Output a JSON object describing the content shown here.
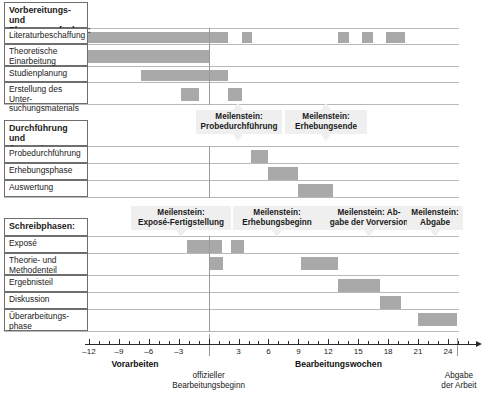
{
  "chart_data": {
    "type": "bar",
    "orientation": "horizontal",
    "xlabel": "Bearbeitungswochen",
    "ylabel": "",
    "xlim": [
      -13,
      27
    ],
    "x_ticks_major": [
      -12,
      -9,
      -6,
      -3,
      0,
      3,
      6,
      9,
      12,
      15,
      18,
      21,
      24
    ],
    "x_tick_labels": [
      "–12",
      "–9",
      "–6",
      "–3",
      "",
      "3",
      "6",
      "9",
      "12",
      "15",
      "18",
      "21",
      "24"
    ],
    "x_tick_step_minor": 1,
    "grid": false,
    "bar_color": "#a9a9a9",
    "reference_line_x": 0,
    "axis_captions": {
      "left": "Vorarbeiten",
      "right": "Bearbeitungswochen",
      "zero_note": "offizieller\nBearbeitungsbeginn",
      "end_note": "Abgabe\nder Arbeit"
    },
    "groups": [
      {
        "id": "vorbereitung",
        "header": "Vorbereitungs- und\nPlanungsaufgaben:",
        "tasks": [
          {
            "label": "Literaturbeschaffung",
            "segments": [
              [
                -12.5,
                0.0
              ],
              [
                0.0,
                1.9
              ],
              [
                3.3,
                4.4
              ],
              [
                13.0,
                14.1
              ],
              [
                15.4,
                16.5
              ],
              [
                17.8,
                19.7
              ]
            ]
          },
          {
            "label": "Theoretische\nEinarbeitung",
            "segments": [
              [
                -12.5,
                0.0
              ]
            ]
          },
          {
            "label": "Studienplanung",
            "segments": [
              [
                -6.8,
                1.9
              ]
            ]
          },
          {
            "label": "Erstellung des Unter-\nsuchungsmaterials",
            "segments": [
              [
                -2.8,
                -1.0
              ],
              [
                1.9,
                3.3
              ]
            ]
          }
        ]
      },
      {
        "id": "durchfuehrung",
        "header": "Durchführung und\nAuswertung:",
        "tasks": [
          {
            "label": "Probedurchführung",
            "segments": [
              [
                4.2,
                6.0
              ]
            ]
          },
          {
            "label": "Erhebungsphase",
            "segments": [
              [
                6.0,
                9.0
              ]
            ]
          },
          {
            "label": "Auswertung",
            "segments": [
              [
                9.0,
                12.5
              ]
            ]
          }
        ]
      },
      {
        "id": "schreibphasen",
        "header": "Schreibphasen:",
        "tasks": [
          {
            "label": "Exposé",
            "segments": [
              [
                -2.2,
                0.0
              ],
              [
                0.0,
                1.3
              ],
              [
                2.2,
                3.5
              ]
            ]
          },
          {
            "label": "Theorie- und\nMethodenteil",
            "segments": [
              [
                0.0,
                1.4
              ],
              [
                9.3,
                13.0
              ]
            ]
          },
          {
            "label": "Ergebnisteil",
            "segments": [
              [
                13.0,
                17.2
              ]
            ]
          },
          {
            "label": "Diskussion",
            "segments": [
              [
                17.2,
                19.3
              ]
            ]
          },
          {
            "label": "Überarbeitungs-\nphase",
            "segments": [
              [
                21.0,
                24.9
              ]
            ]
          }
        ]
      }
    ],
    "milestones": [
      {
        "label": "Meilenstein:\nProbedurchführung",
        "x": 4.2,
        "tier": "mid",
        "side": "both"
      },
      {
        "label": "Meilenstein:\nErhebungsende",
        "x": 9.0,
        "tier": "mid",
        "side": "both"
      },
      {
        "label": "Meilenstein:\nExposé-Fertigstellung",
        "x": 0.0,
        "tier": "low",
        "side": "both"
      },
      {
        "label": "Meilenstein:\nErhebungsbeginn",
        "x": 6.0,
        "tier": "low",
        "side": "both"
      },
      {
        "label": "Meilenstein: Ab-\ngabe der Vorversion",
        "x": 17.2,
        "tier": "low",
        "side": "both"
      },
      {
        "label": "Meilenstein:\nAbgabe",
        "x": 24.9,
        "tier": "low",
        "side": "both"
      }
    ]
  },
  "labels": {
    "group1_header": "Vorbereitungs- und\nPlanungsaufgaben:",
    "t1": "Literaturbeschaffung",
    "t2": "Theoretische\nEinarbeitung",
    "t3": "Studienplanung",
    "t4": "Erstellung des Unter-\nsuchungsmaterials",
    "group2_header": "Durchführung und\nAuswertung:",
    "t5": "Probedurchführung",
    "t6": "Erhebungsphase",
    "t7": "Auswertung",
    "group3_header": "Schreibphasen:",
    "t8": "Exposé",
    "t9": "Theorie- und\nMethodenteil",
    "t10": "Ergebnisteil",
    "t11": "Diskussion",
    "t12": "Überarbeitungs-\nphase"
  },
  "milestone_labels": {
    "m1": "Meilenstein:\nProbedurchführung",
    "m2": "Meilenstein:\nErhebungsende",
    "m3": "Meilenstein:\nExposé-Fertigstellung",
    "m4": "Meilenstein:\nErhebungsbeginn",
    "m5": "Meilenstein: Ab-\ngabe der Vorversion",
    "m6": "Meilenstein:\nAbgabe"
  },
  "axis": {
    "tick_m12": "–12",
    "tick_m9": "–9",
    "tick_m6": "–6",
    "tick_m3": "–3",
    "tick_3": "3",
    "tick_6": "6",
    "tick_9": "9",
    "tick_12": "12",
    "tick_15": "15",
    "tick_18": "18",
    "tick_21": "21",
    "tick_24": "24",
    "cap_left": "Vorarbeiten",
    "cap_right": "Bearbeitungswochen",
    "note_zero": "offizieller\nBearbeitungsbeginn",
    "note_end": "Abgabe\nder Arbeit"
  }
}
